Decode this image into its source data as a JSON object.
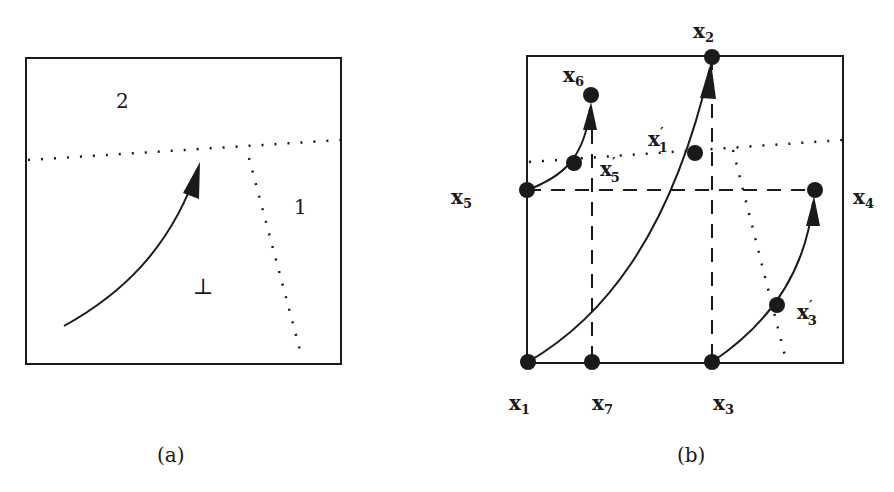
{
  "panels": [
    {
      "id": "a",
      "caption": "(a)",
      "region_labels": {
        "top": "2",
        "right": "1",
        "bottom": "⊥"
      }
    },
    {
      "id": "b",
      "caption": "(b)",
      "points": {
        "x1": {
          "base": "x",
          "sub": "1",
          "prime": ""
        },
        "x2": {
          "base": "x",
          "sub": "2",
          "prime": ""
        },
        "x3": {
          "base": "x",
          "sub": "3",
          "prime": ""
        },
        "x4": {
          "base": "x",
          "sub": "4",
          "prime": ""
        },
        "x5": {
          "base": "x",
          "sub": "5",
          "prime": ""
        },
        "x6": {
          "base": "x",
          "sub": "6",
          "prime": ""
        },
        "x7": {
          "base": "x",
          "sub": "7",
          "prime": ""
        },
        "x1p": {
          "base": "x",
          "sub": "1",
          "prime": "′"
        },
        "x3p": {
          "base": "x",
          "sub": "3",
          "prime": "′"
        },
        "x5p": {
          "base": "x",
          "sub": "5",
          "prime": "′"
        }
      }
    }
  ],
  "colors": {
    "ink": "#1a1a1a",
    "background": "#ffffff"
  }
}
